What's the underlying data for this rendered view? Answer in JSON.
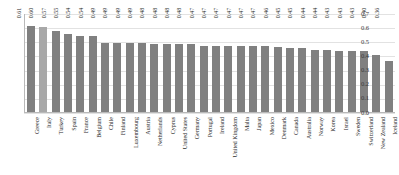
{
  "chart_data": {
    "type": "bar",
    "title": "",
    "subtitle": "",
    "xlabel": "",
    "ylabel": "",
    "ylim": [
      0.0,
      0.7
    ],
    "ytick_labels": [
      "0.7",
      "0.6",
      "0.5",
      "0.4",
      "0.3",
      "0.2",
      "0.1",
      "0.0"
    ],
    "ytick_values": [
      0.7,
      0.6,
      0.5,
      0.4,
      0.3,
      0.2,
      0.1,
      0.0
    ],
    "grid": true,
    "legend": null,
    "legend_position": "none",
    "bar_color": "#808080",
    "highlight_color": "#a8a8a8",
    "highlight_index": 1,
    "categories": [
      "Greece",
      "Italy",
      "Turkey",
      "Spain",
      "France",
      "Belgium",
      "Chile",
      "Finland",
      "Luxembourg",
      "Austria",
      "Netherlands",
      "Cyprus",
      "United States",
      "Germany",
      "Portugal",
      "Ireland",
      "United Kingdom",
      "Malta",
      "Japan",
      "Mexico",
      "Denmark",
      "Canada",
      "Australia",
      "Norway",
      "Korea",
      "Israel",
      "Sweden",
      "Switzerland",
      "New Zealand",
      "Iceland"
    ],
    "values": [
      0.61,
      0.6,
      0.57,
      0.55,
      0.54,
      0.54,
      0.49,
      0.49,
      0.49,
      0.49,
      0.48,
      0.48,
      0.48,
      0.48,
      0.47,
      0.47,
      0.47,
      0.47,
      0.47,
      0.47,
      0.46,
      0.45,
      0.45,
      0.44,
      0.44,
      0.43,
      0.43,
      0.43,
      0.4,
      0.36
    ],
    "value_labels": [
      "0.61",
      "0.60",
      "0.57",
      "0.55",
      "0.54",
      "0.54",
      "0.49",
      "0.49",
      "0.49",
      "0.49",
      "0.48",
      "0.48",
      "0.48",
      "0.48",
      "0.47",
      "0.47",
      "0.47",
      "0.47",
      "0.47",
      "0.47",
      "0.46",
      "0.45",
      "0.45",
      "0.44",
      "0.44",
      "0.43",
      "0.43",
      "0.43",
      "0.40",
      "0.36"
    ]
  }
}
